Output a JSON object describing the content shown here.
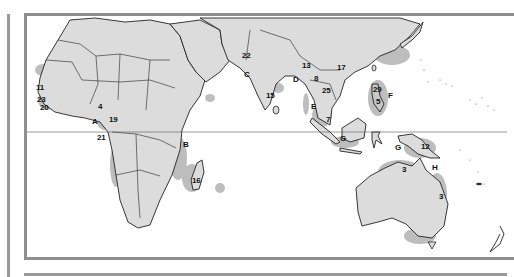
{
  "map": {
    "region": "Africa, South Asia, Southeast Asia and Oceania",
    "colors": {
      "land": "#dcdcdc",
      "highlight": "#b9b9b9",
      "border": "#222222",
      "frame": "#8f8f8f",
      "water": "#ffffff"
    },
    "equator_line": true,
    "number_labels": [
      {
        "id": "11",
        "x": 36,
        "y": 84
      },
      {
        "id": "23",
        "x": 37,
        "y": 96
      },
      {
        "id": "20",
        "x": 40,
        "y": 104
      },
      {
        "id": "4",
        "x": 98,
        "y": 103
      },
      {
        "id": "19",
        "x": 109,
        "y": 116
      },
      {
        "id": "21",
        "x": 97,
        "y": 134
      },
      {
        "id": "22",
        "x": 242,
        "y": 52
      },
      {
        "id": "13",
        "x": 302,
        "y": 62
      },
      {
        "id": "17",
        "x": 337,
        "y": 64
      },
      {
        "id": "8",
        "x": 314,
        "y": 75
      },
      {
        "id": "25",
        "x": 322,
        "y": 87
      },
      {
        "id": "15",
        "x": 266,
        "y": 92
      },
      {
        "id": "29",
        "x": 373,
        "y": 86
      },
      {
        "id": "5",
        "x": 376,
        "y": 98
      },
      {
        "id": "7",
        "x": 326,
        "y": 116
      },
      {
        "id": "12",
        "x": 421,
        "y": 143
      },
      {
        "id": "16",
        "x": 192,
        "y": 177
      },
      {
        "id": "3a",
        "label": "3",
        "x": 402,
        "y": 166
      },
      {
        "id": "3b",
        "label": "3",
        "x": 439,
        "y": 193
      }
    ],
    "letter_labels": [
      {
        "id": "A",
        "x": 92,
        "y": 118
      },
      {
        "id": "B",
        "x": 183,
        "y": 141
      },
      {
        "id": "C",
        "x": 244,
        "y": 71
      },
      {
        "id": "D",
        "x": 293,
        "y": 76
      },
      {
        "id": "E",
        "x": 311,
        "y": 103
      },
      {
        "id": "F",
        "x": 388,
        "y": 92
      },
      {
        "id": "G",
        "x": 340,
        "y": 135
      },
      {
        "id": "G2",
        "label": "G",
        "x": 395,
        "y": 144
      },
      {
        "id": "H",
        "x": 432,
        "y": 164
      }
    ]
  }
}
